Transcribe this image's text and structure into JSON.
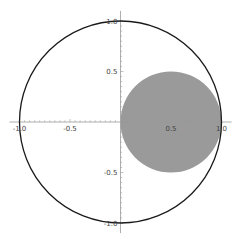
{
  "chart_data": {
    "type": "scatter",
    "title": "",
    "xlabel": "",
    "ylabel": "",
    "xlim": [
      -1.1,
      1.1
    ],
    "ylim": [
      -1.1,
      1.1
    ],
    "grid": false,
    "axes_origin": [
      0,
      0
    ],
    "x_ticks": [
      -1.0,
      -0.5,
      0.5,
      1.0
    ],
    "x_tick_labels": [
      "-1.0",
      "-0.5",
      "0.5",
      "1.0"
    ],
    "y_ticks": [
      -1.0,
      -0.5,
      0.5,
      1.0
    ],
    "y_tick_labels": [
      "-1.0",
      "-0.5",
      "0.5",
      "1.0"
    ],
    "shapes": [
      {
        "name": "unit-circle",
        "kind": "circle",
        "center": [
          0,
          0
        ],
        "radius": 1.0,
        "fill": "none",
        "stroke": "#1a1a1a"
      },
      {
        "name": "filled-disk",
        "kind": "disk",
        "center": [
          0.5,
          0
        ],
        "radius": 0.5,
        "fill": "#9a9a9a",
        "stroke": "none"
      }
    ]
  },
  "colors": {
    "axis": "#999999",
    "circle_stroke": "#1a1a1a",
    "disk_fill": "#9a9a9a",
    "label": "#444444"
  }
}
